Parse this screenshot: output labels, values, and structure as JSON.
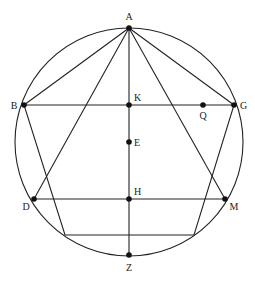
{
  "diagram": {
    "type": "geometric-construction",
    "circle": {
      "cx": 129,
      "cy": 142,
      "r": 114
    },
    "points": [
      {
        "name": "A",
        "x": 129,
        "y": 28,
        "dot": true,
        "lx": 129,
        "ly": 20,
        "anchor": "middle"
      },
      {
        "name": "B",
        "x": 24,
        "y": 105,
        "dot": true,
        "lx": 14,
        "ly": 109,
        "anchor": "middle"
      },
      {
        "name": "K",
        "x": 129,
        "y": 105,
        "dot": true,
        "lx": 134,
        "ly": 101,
        "anchor": "start"
      },
      {
        "name": "Q",
        "x": 203,
        "y": 105,
        "dot": true,
        "lx": 203,
        "ly": 119,
        "anchor": "middle"
      },
      {
        "name": "G",
        "x": 234,
        "y": 105,
        "dot": true,
        "lx": 240,
        "ly": 109,
        "anchor": "start"
      },
      {
        "name": "E",
        "x": 129,
        "y": 142,
        "dot": true,
        "lx": 134,
        "ly": 146,
        "anchor": "start"
      },
      {
        "name": "D",
        "x": 34,
        "y": 199,
        "dot": true,
        "lx": 26,
        "ly": 210,
        "anchor": "middle"
      },
      {
        "name": "H",
        "x": 129,
        "y": 199,
        "dot": true,
        "lx": 134,
        "ly": 195,
        "anchor": "start"
      },
      {
        "name": "M",
        "x": 225,
        "y": 199,
        "dot": true,
        "lx": 234,
        "ly": 210,
        "anchor": "middle"
      },
      {
        "name": "Z",
        "x": 129,
        "y": 255,
        "dot": true,
        "lx": 129,
        "ly": 271,
        "anchor": "middle"
      }
    ],
    "pentagon": [
      [
        129,
        28
      ],
      [
        234,
        105
      ],
      [
        194,
        235
      ],
      [
        65,
        235
      ],
      [
        24,
        105
      ]
    ],
    "segments": [
      [
        24,
        105,
        234,
        105
      ],
      [
        34,
        199,
        225,
        199
      ],
      [
        129,
        28,
        129,
        255
      ],
      [
        129,
        28,
        34,
        199
      ],
      [
        129,
        28,
        225,
        199
      ]
    ],
    "labels": [
      "A",
      "B",
      "K",
      "Q",
      "G",
      "E",
      "D",
      "H",
      "M",
      "Z"
    ]
  }
}
